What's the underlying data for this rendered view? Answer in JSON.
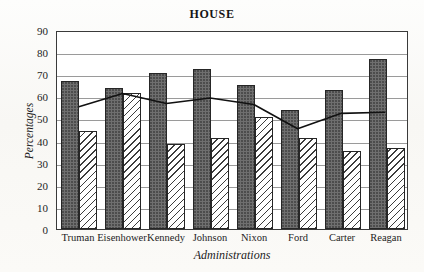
{
  "chart_data": {
    "type": "bar",
    "title": "HOUSE",
    "xlabel": "Administrations",
    "ylabel": "Percentages",
    "categories": [
      "Truman",
      "Eisenhower",
      "Kennedy",
      "Johnson",
      "Nixon",
      "Ford",
      "Carter",
      "Reagan"
    ],
    "ylim": [
      0,
      90
    ],
    "ytick_values": [
      0,
      10,
      20,
      30,
      40,
      50,
      60,
      70,
      80,
      90
    ],
    "ytick_labels": [
      "0",
      "10",
      "20",
      "30",
      "40",
      "50",
      "60",
      "70",
      "80",
      "90"
    ],
    "grid": "horizontal",
    "legend": "none",
    "series": [
      {
        "name": "solid-dark-bar",
        "render": "bar",
        "fill": "stippled-dark-gray",
        "color": "#6f6f6f",
        "values": [
          67,
          64,
          70.5,
          72.5,
          65,
          54,
          63,
          77
        ]
      },
      {
        "name": "hatched-light-bar",
        "render": "bar",
        "fill": "diagonal-hatch",
        "color": "#ffffff",
        "values": [
          44.5,
          61.5,
          38.5,
          41,
          50.5,
          41,
          35.5,
          36.5
        ]
      },
      {
        "name": "trend-line",
        "render": "line",
        "color": "#111111",
        "values": [
          56,
          62,
          57.5,
          60,
          57,
          46,
          53,
          53.5
        ]
      }
    ]
  },
  "colors": {
    "frame": "#3a3a3a",
    "gridline": "#9a9a9a",
    "bar_solid": "#6f6f6f",
    "bar_hatch_line": "#3c3c3c",
    "line_series": "#111111",
    "text": "#1d1d1d",
    "paper": "#fbfaf8"
  }
}
